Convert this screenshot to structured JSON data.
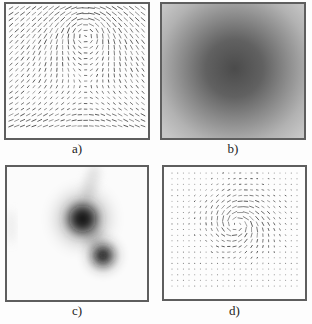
{
  "figure": {
    "background": "#fdfdfd",
    "panels": [
      {
        "id": "a",
        "label": "a)"
      },
      {
        "id": "b",
        "label": "b)"
      },
      {
        "id": "c",
        "label": "c)"
      },
      {
        "id": "d",
        "label": "d)"
      }
    ]
  },
  "chart_data": [
    {
      "panel": "a",
      "type": "scatter",
      "subtype": "quiver",
      "title": "",
      "description": "Dense grid of short stroke vectors: uniform rightward flow plus a broad vortex centered near the top middle. Strokes are long and nearly horizontal along the top-center and bottom rows, tilted up-right on the left half, tilted down-right on the right half.",
      "grid": {
        "cols": 24,
        "rows": 22
      },
      "field": {
        "model": "uniform_plus_vortex",
        "uniform": [
          0.48,
          0
        ],
        "vortex_center": [
          0.56,
          0.18
        ],
        "vortex_strength": 1.05,
        "decay_length": 0.55,
        "core_radius": 0.12
      },
      "style": {
        "stroke": "#383838",
        "len_model": "affine",
        "min_len_px": 2.6,
        "max_len_px": 6.6,
        "bottom_row_boost": 1.35,
        "margins": {
          "t": 4,
          "l": 5,
          "r": 5,
          "b": 12
        },
        "seed": 13
      }
    },
    {
      "panel": "b",
      "type": "heatmap",
      "title": "",
      "description": "Smooth grayscale intensity map: a dark gray Gaussian blob centered near the middle of the frame, fading radially to light gray at the borders.",
      "center": [
        0.51,
        0.48
      ],
      "radius_fraction": 0.67,
      "stops": [
        {
          "offset": 0,
          "color": "#4b4b4b"
        },
        {
          "offset": 0.3,
          "color": "#616161"
        },
        {
          "offset": 0.55,
          "color": "#8a8a8a"
        },
        {
          "offset": 0.8,
          "color": "#b2b2b2"
        },
        {
          "offset": 1,
          "color": "#c7c7c7"
        }
      ]
    },
    {
      "panel": "c",
      "type": "heatmap",
      "title": "",
      "description": "Near-white image with two dark blurred blobs: a large dark blob above-left of center and a smaller dark blob below-right of it, with faint gray smudges between them, toward the top edge and along the left edge.",
      "background": "#fbfbfb",
      "blobs": [
        {
          "cx": 0.54,
          "cy": 0.39,
          "core_radius": 0.095,
          "blur": 0.04,
          "color": "#0f0f0f"
        },
        {
          "cx": 0.685,
          "cy": 0.665,
          "core_radius": 0.062,
          "blur": 0.035,
          "color": "#1a1a1a"
        }
      ],
      "smudges": [
        {
          "cx": 0.6,
          "cy": 0.12,
          "rx": 0.05,
          "ry": 0.14,
          "rotate": 16,
          "color": "#c9c9c9",
          "opacity": 0.55
        },
        {
          "cx": 0.62,
          "cy": 0.53,
          "rx": 0.055,
          "ry": 0.08,
          "rotate": 40,
          "color": "#bdbdbd",
          "opacity": 0.5
        },
        {
          "cx": 0.03,
          "cy": 0.45,
          "rx": 0.022,
          "ry": 0.13,
          "rotate": 0,
          "color": "#d9d9d9",
          "opacity": 0.6
        }
      ]
    },
    {
      "panel": "d",
      "type": "scatter",
      "subtype": "quiver",
      "title": "",
      "description": "Sparse vector field: a regular grid of tiny dots with a localized fingerprint-like vortex whorl just above and left of center; stroke length decays rapidly with distance from the vortex core, leaving only dots near the borders.",
      "grid": {
        "cols": 23,
        "rows": 21
      },
      "field": {
        "model": "gaussian_vortex",
        "uniform": [
          0.1,
          0.02
        ],
        "vortex_center": [
          0.52,
          0.43
        ],
        "sigma": 0.27,
        "core_radius": 0.07,
        "spiral_deg": -18
      },
      "style": {
        "stroke": "#3a3a3a",
        "len_model": "gauss",
        "max_len_px": 6.2,
        "dot_threshold_px": 1.5,
        "dot_radius_px": 0.55,
        "dot_color": "#4f4f4f",
        "margins": {
          "t": 6,
          "l": 8,
          "r": 8,
          "b": 13
        },
        "seed": 5
      }
    }
  ]
}
